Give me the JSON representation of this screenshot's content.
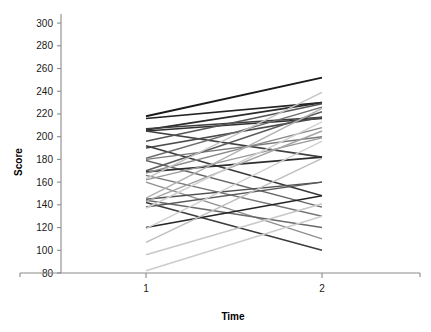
{
  "chart_data": {
    "type": "line",
    "title": "",
    "subtitle": "",
    "xlabel": "Time",
    "ylabel": "Score",
    "x": [
      1,
      2
    ],
    "xtick_labels": [
      "1",
      "2"
    ],
    "xlim": [
      0.55,
      2.45
    ],
    "ylim": [
      80,
      308
    ],
    "ytick_labels": [
      "80",
      "100",
      "120",
      "140",
      "160",
      "180",
      "200",
      "220",
      "240",
      "260",
      "280",
      "300"
    ],
    "yticks": [
      80,
      100,
      120,
      140,
      160,
      180,
      200,
      220,
      240,
      260,
      280,
      300
    ],
    "grid": false,
    "legend": null,
    "legend_position": "none",
    "note": "Spaghetti plot: one line per subject connecting Score at Time 1 to Score at Time 2. Line greyscale shade varies per subject.",
    "series": [
      {
        "name": "s01",
        "values": [
          218,
          252
        ],
        "color": "#1a1a1a",
        "width": 1.9
      },
      {
        "name": "s02",
        "values": [
          216,
          230
        ],
        "color": "#222222",
        "width": 1.7
      },
      {
        "name": "s03",
        "values": [
          206,
          230
        ],
        "color": "#2b2b2b",
        "width": 1.7
      },
      {
        "name": "s04",
        "values": [
          205,
          216
        ],
        "color": "#303030",
        "width": 1.7
      },
      {
        "name": "s05",
        "values": [
          207,
          217
        ],
        "color": "#3d3d3d",
        "width": 1.5
      },
      {
        "name": "s06",
        "values": [
          205,
          182
        ],
        "color": "#404040",
        "width": 1.6
      },
      {
        "name": "s07",
        "values": [
          196,
          229
        ],
        "color": "#555555",
        "width": 1.5
      },
      {
        "name": "s08",
        "values": [
          190,
          217
        ],
        "color": "#4a4a4a",
        "width": 1.6
      },
      {
        "name": "s09",
        "values": [
          192,
          148
        ],
        "color": "#3a3a3a",
        "width": 1.6
      },
      {
        "name": "s10",
        "values": [
          181,
          226
        ],
        "color": "#6e6e6e",
        "width": 1.4
      },
      {
        "name": "s11",
        "values": [
          180,
          200
        ],
        "color": "#7a7a7a",
        "width": 1.4
      },
      {
        "name": "s12",
        "values": [
          179,
          138
        ],
        "color": "#666666",
        "width": 1.5
      },
      {
        "name": "s13",
        "values": [
          170,
          222
        ],
        "color": "#5c5c5c",
        "width": 1.5
      },
      {
        "name": "s14",
        "values": [
          169,
          182
        ],
        "color": "#2e2e2e",
        "width": 1.7
      },
      {
        "name": "s15",
        "values": [
          168,
          208
        ],
        "color": "#8a8a8a",
        "width": 1.4
      },
      {
        "name": "s16",
        "values": [
          166,
          130
        ],
        "color": "#777777",
        "width": 1.4
      },
      {
        "name": "s17",
        "values": [
          163,
          239
        ],
        "color": "#c4c4c4",
        "width": 1.4
      },
      {
        "name": "s18",
        "values": [
          162,
          199
        ],
        "color": "#999999",
        "width": 1.3
      },
      {
        "name": "s19",
        "values": [
          160,
          110
        ],
        "color": "#8f8f8f",
        "width": 1.4
      },
      {
        "name": "s20",
        "values": [
          146,
          225
        ],
        "color": "#b0b0b0",
        "width": 1.4
      },
      {
        "name": "s21",
        "values": [
          145,
          160
        ],
        "color": "#4f4f4f",
        "width": 1.5
      },
      {
        "name": "s22",
        "values": [
          144,
          120
        ],
        "color": "#6a6a6a",
        "width": 1.5
      },
      {
        "name": "s23",
        "values": [
          143,
          205
        ],
        "color": "#a5a5a5",
        "width": 1.4
      },
      {
        "name": "s24",
        "values": [
          142,
          100
        ],
        "color": "#3c3c3c",
        "width": 1.6
      },
      {
        "name": "s25",
        "values": [
          138,
          160
        ],
        "color": "#5a5a5a",
        "width": 1.5
      },
      {
        "name": "s26",
        "values": [
          137,
          213
        ],
        "color": "#d0d0d0",
        "width": 1.4
      },
      {
        "name": "s27",
        "values": [
          120,
          148
        ],
        "color": "#262626",
        "width": 1.6
      },
      {
        "name": "s28",
        "values": [
          119,
          196
        ],
        "color": "#cfcfcf",
        "width": 1.4
      },
      {
        "name": "s29",
        "values": [
          107,
          181
        ],
        "color": "#bdbdbd",
        "width": 1.4
      },
      {
        "name": "s30",
        "values": [
          96,
          141
        ],
        "color": "#c8c8c8",
        "width": 1.5
      },
      {
        "name": "s31",
        "values": [
          82,
          130
        ],
        "color": "#cccccc",
        "width": 1.5
      }
    ]
  },
  "axes": {
    "y_title": "Score",
    "x_title": "Time"
  }
}
